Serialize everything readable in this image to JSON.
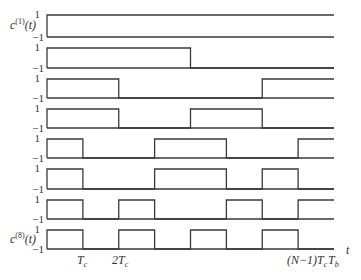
{
  "diagram": {
    "plot": {
      "x_start": 47,
      "x_end": 334,
      "num_chips": 8
    },
    "level_labels": {
      "high": "1",
      "low": "−1"
    },
    "signal_labels": [
      {
        "row": 0,
        "base": "c",
        "sup": "(1)",
        "arg": "(t)"
      },
      {
        "row": 7,
        "base": "c",
        "sup": "(8)",
        "arg": "(t)"
      }
    ],
    "rows": [
      {
        "top": 15,
        "bottom": 37,
        "chips": [
          1,
          1,
          1,
          1,
          1,
          1,
          1,
          1
        ]
      },
      {
        "top": 48,
        "bottom": 68,
        "chips": [
          1,
          1,
          1,
          1,
          0,
          0,
          0,
          0
        ]
      },
      {
        "top": 79,
        "bottom": 98,
        "chips": [
          1,
          1,
          0,
          0,
          0,
          0,
          1,
          1
        ]
      },
      {
        "top": 109,
        "bottom": 128,
        "chips": [
          1,
          1,
          0,
          0,
          1,
          1,
          0,
          0
        ]
      },
      {
        "top": 139,
        "bottom": 158,
        "chips": [
          1,
          0,
          0,
          1,
          1,
          0,
          0,
          1
        ]
      },
      {
        "top": 169,
        "bottom": 189,
        "chips": [
          1,
          0,
          0,
          1,
          1,
          0,
          1,
          0
        ]
      },
      {
        "top": 200,
        "bottom": 219,
        "chips": [
          1,
          0,
          1,
          0,
          0,
          1,
          0,
          1
        ]
      },
      {
        "top": 230,
        "bottom": 249,
        "chips": [
          1,
          0,
          1,
          0,
          1,
          0,
          1,
          0
        ]
      }
    ],
    "x_axis": {
      "ticks": [
        {
          "label": "T",
          "sub": "c",
          "x": 77
        },
        {
          "label": "2T",
          "sub": "c",
          "x": 112
        },
        {
          "label": "(N−1)T",
          "sub": "c",
          "x": 287
        },
        {
          "label": "T",
          "sub": "b",
          "x": 328
        }
      ],
      "axis_label": "t"
    },
    "colors": {
      "stroke": "#3a3a3a",
      "text": "#333333",
      "background": "#ffffff"
    }
  }
}
